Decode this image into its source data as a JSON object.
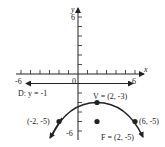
{
  "figure": {
    "type": "parabola-graph",
    "axes": {
      "x_label": "x",
      "y_label": "y",
      "x_range": [
        -6,
        6
      ],
      "y_range": [
        -6,
        6
      ],
      "x_tick_labels": [
        "-6",
        "0",
        "6"
      ],
      "y_tick_labels": [
        "6",
        "-6"
      ],
      "origin_label": "0"
    },
    "directrix": {
      "label": "D: y = -1",
      "y": -1
    },
    "vertex": {
      "label": "V = (2, -3)",
      "x": 2,
      "y": -3
    },
    "focus": {
      "label": "F = (2, -5)",
      "x": 2,
      "y": -5
    },
    "points": [
      {
        "label": "(-2, -5)",
        "x": -2,
        "y": -5
      },
      {
        "label": "(6, -5)",
        "x": 6,
        "y": -5
      }
    ],
    "colors": {
      "ink": "#222222",
      "background": "#ffffff"
    }
  }
}
